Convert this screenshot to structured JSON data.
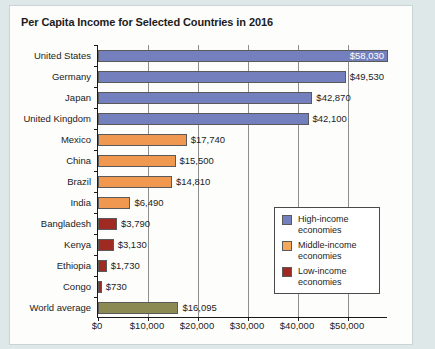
{
  "figure": {
    "title": "Per Capita Income for Selected Countries in 2016"
  },
  "legend": {
    "items": [
      {
        "label": "High-income economies",
        "color": "#7380bd"
      },
      {
        "label": "Middle-income economies",
        "color": "#f5a85a"
      },
      {
        "label": "Low-income economies",
        "color": "#9e2a22"
      }
    ]
  },
  "chart_data": {
    "type": "bar",
    "orientation": "horizontal",
    "title": "Per Capita Income for Selected Countries in 2016",
    "xlabel": "",
    "ylabel": "",
    "xlim": [
      0,
      58000
    ],
    "xticks": [
      0,
      10000,
      20000,
      30000,
      40000,
      50000
    ],
    "xtick_labels": [
      "$0",
      "$10,000",
      "$20,000",
      "$30,000",
      "$40,000",
      "$50,000"
    ],
    "grid": true,
    "legend_position": "center-right",
    "categories": [
      "United States",
      "Germany",
      "Japan",
      "United Kingdom",
      "Mexico",
      "China",
      "Brazil",
      "India",
      "Bangladesh",
      "Kenya",
      "Ethiopia",
      "Congo",
      "World average"
    ],
    "values": [
      58030,
      49530,
      42870,
      42100,
      17740,
      15500,
      14810,
      6490,
      3790,
      3130,
      1730,
      730,
      16095
    ],
    "value_labels": [
      "$58,030",
      "$49,530",
      "$42,870",
      "$42,100",
      "$17,740",
      "$15,500",
      "$14,810",
      "$6,490",
      "$3,790",
      "$3,130",
      "$1,730",
      "$730",
      "$16,095"
    ],
    "label_inside": [
      true,
      false,
      false,
      false,
      false,
      false,
      false,
      false,
      false,
      false,
      false,
      false,
      false
    ],
    "groups": [
      "high-income",
      "high-income",
      "high-income",
      "high-income",
      "middle-income",
      "middle-income",
      "middle-income",
      "middle-income",
      "low-income",
      "low-income",
      "low-income",
      "low-income",
      "world-average"
    ],
    "colors": [
      "#7380bd",
      "#7380bd",
      "#7380bd",
      "#7380bd",
      "#f0984f",
      "#f0984f",
      "#f0984f",
      "#f0984f",
      "#9e2a22",
      "#9e2a22",
      "#9e2a22",
      "#9e2a22",
      "#8a8a52"
    ]
  }
}
